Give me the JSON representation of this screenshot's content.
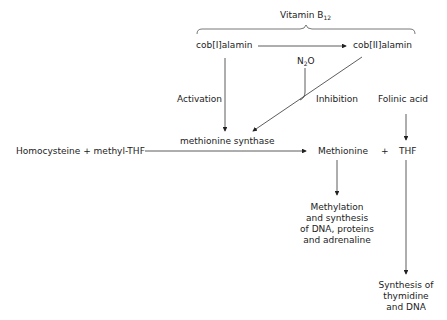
{
  "diagram": {
    "group_label": "Vitamin B",
    "group_label_subscript": "12",
    "nodes": {
      "cob1": "cob[I]alamin",
      "cob2": "cob[II]alamin",
      "n2o_main": "N",
      "n2o_sub": "2",
      "n2o_tail": "O",
      "activation": "Activation",
      "inhibition": "Inhibition",
      "folinic_acid": "Folinic acid",
      "enzyme": "methionine synthase",
      "substrate": "Homocysteine + methyl-THF",
      "methionine": "Methionine",
      "plus": "+",
      "thf": "THF",
      "methylation": [
        "Methylation",
        "and synthesis",
        "of DNA, proteins",
        "and adrenaline"
      ],
      "thymidine": [
        "Synthesis of",
        "thymidine",
        "and DNA"
      ]
    },
    "edges": [
      {
        "from": "cob1",
        "to": "cob2",
        "type": "arrow"
      },
      {
        "from": "cob1",
        "to": "enzyme",
        "label": "Activation"
      },
      {
        "from": "cob2",
        "to": "enzyme",
        "label": "Inhibition"
      },
      {
        "from": "n2o",
        "to": "cob1-cob2 conversion",
        "type": "line"
      },
      {
        "from": "substrate",
        "to": "methionine",
        "label": "methionine synthase"
      },
      {
        "from": "folinic_acid",
        "to": "thf"
      },
      {
        "from": "methionine",
        "to": "methylation"
      },
      {
        "from": "thf",
        "to": "thymidine"
      }
    ],
    "colors": {
      "line": "#333333",
      "text": "#222222"
    }
  }
}
